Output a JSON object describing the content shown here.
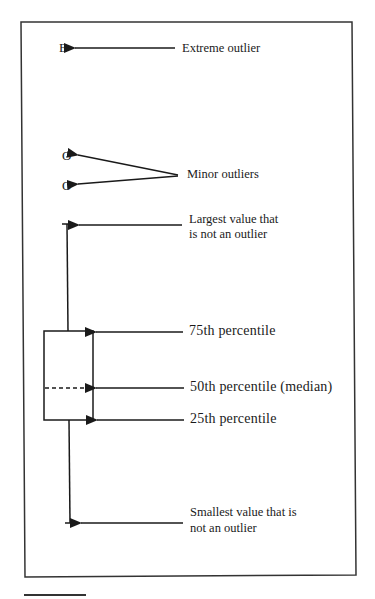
{
  "diagram": {
    "type": "annotated box plot",
    "markers": {
      "extreme": "E",
      "minor1": "O",
      "minor2": "O"
    },
    "labels": {
      "extreme_outlier": "Extreme outlier",
      "minor_outliers": "Minor outliers",
      "largest_line1": "Largest value that",
      "largest_line2": "is not an outlier",
      "p75": "75th  percentile",
      "p50": "50th  percentile  (median)",
      "p25": "25th  percentile",
      "smallest_line1": "Smallest value that is",
      "smallest_line2": "not an outlier"
    },
    "colors": {
      "ink": "#1a1a1a",
      "background": "#ffffff"
    }
  }
}
